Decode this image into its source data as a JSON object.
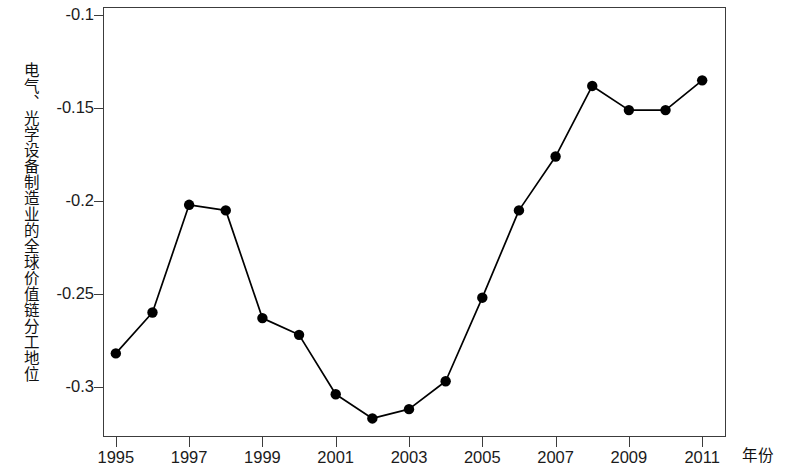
{
  "chart_data": {
    "type": "line",
    "title": "",
    "subtitle": "",
    "xlabel": "年份",
    "ylabel": "电气、光学设备制造业的全球价值链分工地位",
    "x": [
      1995,
      1996,
      1997,
      1998,
      1999,
      2000,
      2001,
      2002,
      2003,
      2004,
      2005,
      2006,
      2007,
      2008,
      2009,
      2010,
      2011
    ],
    "values": [
      -0.282,
      -0.26,
      -0.202,
      -0.205,
      -0.263,
      -0.272,
      -0.304,
      -0.317,
      -0.312,
      -0.297,
      -0.252,
      -0.205,
      -0.176,
      -0.138,
      -0.151,
      -0.151,
      -0.135
    ],
    "series": [
      {
        "name": "电气、光学设备制造业的全球价值链分工地位",
        "values": [
          -0.282,
          -0.26,
          -0.202,
          -0.205,
          -0.263,
          -0.272,
          -0.304,
          -0.317,
          -0.312,
          -0.297,
          -0.252,
          -0.205,
          -0.176,
          -0.138,
          -0.151,
          -0.151,
          -0.135
        ]
      }
    ],
    "xlim": [
      1994.65,
      2011.65
    ],
    "ylim": [
      -0.327,
      -0.0955
    ],
    "ytick_labels": [
      "-0.1",
      "-0.15",
      "-0.2",
      "-0.25",
      "-0.3"
    ],
    "ytick_values": [
      -0.1,
      -0.15,
      -0.2,
      -0.25,
      -0.3
    ],
    "xtick_labels": [
      "1995",
      "1997",
      "1999",
      "2001",
      "2003",
      "2005",
      "2007",
      "2009",
      "2011"
    ],
    "xtick_values": [
      1995,
      1997,
      1999,
      2001,
      2003,
      2005,
      2007,
      2009,
      2011
    ],
    "grid": false,
    "legend": false,
    "legend_position": "none",
    "line_color": "#000000",
    "marker": "filled-circle",
    "marker_color": "#000000",
    "background_color": "#ffffff",
    "frame_color": "#3c3c3c"
  }
}
